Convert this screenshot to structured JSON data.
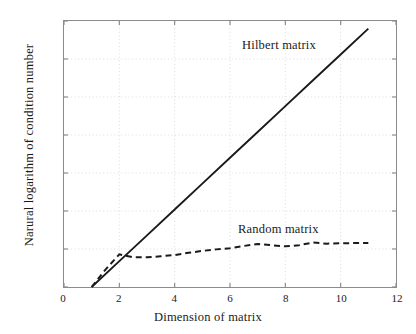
{
  "figure": {
    "background_color": "#ffffff",
    "frame_color": "#8c8c8c",
    "grid_color": "#dcdcdc",
    "ink_color": "#1a1a1a"
  },
  "chart_data": {
    "type": "line",
    "title": "",
    "xlabel": "Dimension of matrix",
    "ylabel": "Narural logarithm of condition number",
    "xlim": [
      0,
      12
    ],
    "ylim": [
      0,
      35
    ],
    "xticks": [
      0,
      2,
      4,
      6,
      8,
      10,
      12
    ],
    "yticks": [
      0,
      5,
      10,
      15,
      20,
      25,
      30,
      35
    ],
    "grid": true,
    "grid_style": "dotted",
    "legend": "inline-annotations",
    "series": [
      {
        "name": "Hilbert matrix",
        "style": "solid",
        "color": "#1a1a1a",
        "x": [
          1,
          2,
          3,
          4,
          5,
          6,
          7,
          8,
          9,
          10,
          11
        ],
        "values": [
          0.0,
          3.4,
          6.8,
          10.2,
          13.6,
          17.0,
          20.4,
          23.8,
          27.2,
          30.6,
          34.0
        ]
      },
      {
        "name": "Random matrix",
        "style": "dashed",
        "color": "#1a1a1a",
        "x": [
          1,
          1.5,
          2,
          2.5,
          3,
          3.5,
          4,
          4.5,
          5,
          5.5,
          6,
          6.5,
          7,
          7.5,
          8,
          8.5,
          9,
          9.5,
          10,
          10.5,
          11
        ],
        "values": [
          0.0,
          2.3,
          4.3,
          3.9,
          3.9,
          4.05,
          4.2,
          4.5,
          4.75,
          4.95,
          5.1,
          5.4,
          5.65,
          5.5,
          5.35,
          5.5,
          5.85,
          5.7,
          5.75,
          5.78,
          5.8
        ]
      }
    ],
    "annotations": [
      {
        "text": "Hilbert matrix",
        "x": 9.0,
        "y": 32.0
      },
      {
        "text": "Random matrix",
        "x": 8.9,
        "y": 8.5
      }
    ]
  }
}
